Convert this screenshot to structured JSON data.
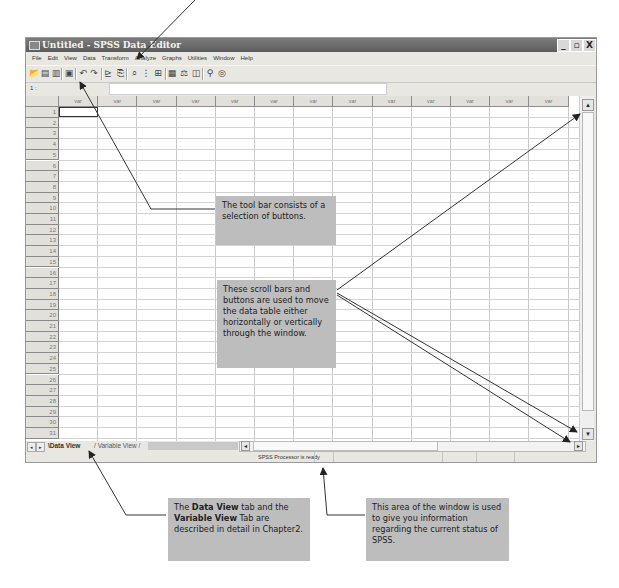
{
  "window": {
    "title": "Untitled - SPSS Data Editor",
    "controls": {
      "minimize": "_",
      "maximize": "▫",
      "close": "X"
    }
  },
  "menu": [
    "File",
    "Edit",
    "View",
    "Data",
    "Transform",
    "Analyze",
    "Graphs",
    "Utilities",
    "Window",
    "Help"
  ],
  "toolbar": {
    "buttons": [
      {
        "name": "open-icon",
        "glyph": "📂"
      },
      {
        "name": "save-icon",
        "glyph": "▤"
      },
      {
        "name": "print-icon",
        "glyph": "▥"
      },
      {
        "name": "dialog-recall-icon",
        "glyph": "▣"
      },
      {
        "name": "undo-icon",
        "glyph": "↶"
      },
      {
        "name": "redo-icon",
        "glyph": "↷"
      },
      {
        "name": "goto-chart-icon",
        "glyph": "⊵"
      },
      {
        "name": "goto-case-icon",
        "glyph": "⎘"
      },
      {
        "name": "find-icon",
        "glyph": "⌕"
      },
      {
        "name": "insert-case-icon",
        "glyph": "⋮"
      },
      {
        "name": "insert-variable-icon",
        "glyph": "⊞"
      },
      {
        "name": "split-file-icon",
        "glyph": "▦"
      },
      {
        "name": "weight-cases-icon",
        "glyph": "⚖"
      },
      {
        "name": "select-cases-icon",
        "glyph": "◫"
      },
      {
        "name": "value-labels-icon",
        "glyph": "⚲"
      },
      {
        "name": "use-sets-icon",
        "glyph": "◎"
      }
    ]
  },
  "cell_reference": {
    "label": "1 :",
    "value": ""
  },
  "grid": {
    "column_header": "var",
    "column_count": 13,
    "row_numbers": [
      "1",
      "2",
      "3",
      "4",
      "5",
      "6",
      "7",
      "8",
      "9",
      "10",
      "11",
      "12",
      "13",
      "14",
      "15",
      "16",
      "17",
      "18",
      "19",
      "20",
      "21",
      "22",
      "23",
      "24",
      "25",
      "26",
      "27",
      "28",
      "29",
      "30",
      "31"
    ],
    "active_cell": {
      "row": "1",
      "column": "var"
    }
  },
  "tabs": {
    "nav_prev": "◂",
    "nav_next": "▸",
    "items": [
      {
        "label": "Data View",
        "active": true
      },
      {
        "label": "Variable View",
        "active": false
      }
    ]
  },
  "scroll": {
    "up": "▲",
    "down": "▼",
    "left": "◂",
    "right": "▸"
  },
  "status": {
    "text": "SPSS Processor  is ready"
  },
  "callouts": {
    "toolbar": "The tool bar consists of a selection of buttons.",
    "scrollbars": "These scroll bars and buttons are used to move the data table either horizontally or vertically through the window.",
    "tabs": {
      "p1": "The ",
      "b1": "Data View",
      "p2": " tab and the ",
      "b2": "Variable View",
      "p3": " Tab are described in detail in Chapter2."
    },
    "status": "This area of the window is used to give you information regarding the current status of SPSS."
  },
  "colors": {
    "titlebar": "#6b6b6b",
    "callout_bg": "#bdbdbd",
    "window_bg": "#e9e7e2"
  }
}
